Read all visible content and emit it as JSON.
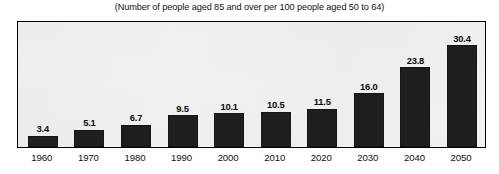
{
  "chart_data": {
    "type": "bar",
    "title": "(Number of people aged 85 and over per 100 people aged 50 to 64)",
    "xlabel": "",
    "ylabel": "",
    "grid": false,
    "legend": false,
    "ylim": [
      0,
      37
    ],
    "categories": [
      "1960",
      "1970",
      "1980",
      "1990",
      "2000",
      "2010",
      "2020",
      "2030",
      "2040",
      "2050"
    ],
    "values": [
      3.4,
      5.1,
      6.7,
      9.5,
      10.1,
      10.5,
      11.5,
      16.0,
      23.8,
      30.4
    ],
    "value_labels": [
      "3.4",
      "5.1",
      "6.7",
      "9.5",
      "10.1",
      "10.5",
      "11.5",
      "16.0",
      "23.8",
      "30.4"
    ],
    "bar_color": "#1e1e1e",
    "plot_background": "#f1f1f1",
    "frame_color": "#000000"
  }
}
